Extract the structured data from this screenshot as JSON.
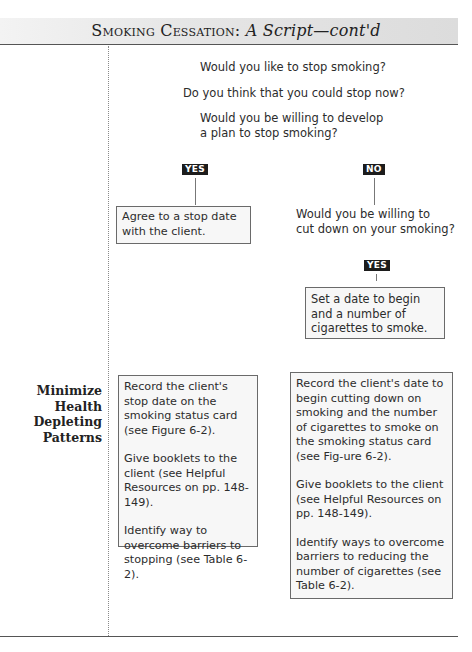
{
  "header": {
    "title_smallcaps": "Smoking Cessation:",
    "title_italic": "A Script—cont'd"
  },
  "questions": [
    "Would you like to stop smoking?",
    "Do you think that you could stop now?",
    "Would you be willing to develop",
    "a plan to stop smoking?"
  ],
  "branches": {
    "yes_label": "YES",
    "no_label": "NO",
    "yes_box": "Agree to a stop date with the client.",
    "no_question_line1": "Would you be willing to",
    "no_question_line2": "cut down on your smoking?",
    "no_yes_label": "YES",
    "no_yes_box": "Set a date to begin and a number of cigarettes to smoke."
  },
  "section": {
    "label_lines": [
      "Minimize",
      "Health",
      "Depleting",
      "Patterns"
    ],
    "left_box": [
      "Record the client's stop date on the smoking status card (see Figure 6-2).",
      "Give booklets to the client (see Helpful Resources on pp. 148-149).",
      "Identify way to overcome barriers to stopping (see Table 6-2)."
    ],
    "right_box": [
      "Record the client's date to begin cutting down on smoking and the number of cigarettes to smoke on the smoking status card (see Fig-ure 6-2).",
      "Give booklets to the client (see Helpful Resources on pp. 148-149).",
      "Identify ways to overcome barriers to reducing the number of cigarettes (see Table 6-2)."
    ]
  }
}
